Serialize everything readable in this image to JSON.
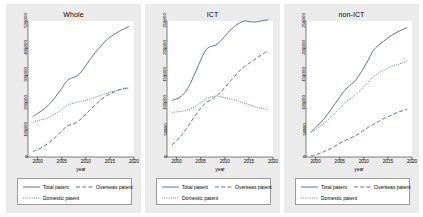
{
  "figure": {
    "background_color": "#ebebeb",
    "plot_background_color": "#ffffff",
    "line_color": "#4a5a7a",
    "axis_color": "#000000"
  },
  "legend": {
    "total_label": "Total patent",
    "overseas_label": "Overseas patent",
    "domestic_label": "Domestic patent"
  },
  "chart_data": [
    {
      "type": "line",
      "title": "Whole",
      "xlabel": "year",
      "ylabel": "",
      "xlim": [
        1998,
        2020
      ],
      "ylim": [
        0,
        500000
      ],
      "xticks": [
        2000,
        2005,
        2010,
        2015,
        2020
      ],
      "yticks": [
        0,
        100000,
        200000,
        300000,
        400000,
        500000
      ],
      "ytick_labels": [
        "0",
        "100000",
        "200000",
        "300000",
        "400000",
        "500000"
      ],
      "xtick_labels": [
        "2000",
        "2005",
        "2010",
        "2015",
        "2020"
      ],
      "grid": false,
      "legend_position": "below",
      "x": [
        1999,
        2000,
        2001,
        2002,
        2003,
        2004,
        2005,
        2006,
        2007,
        2008,
        2009,
        2010,
        2011,
        2012,
        2013,
        2014,
        2015,
        2016,
        2017,
        2018,
        2019
      ],
      "series": [
        {
          "name": "Total patent",
          "style": "solid",
          "values": [
            148000,
            160000,
            172000,
            187000,
            205000,
            228000,
            252000,
            278000,
            290000,
            296000,
            312000,
            336000,
            362000,
            385000,
            405000,
            425000,
            440000,
            452000,
            463000,
            472000,
            480000
          ]
        },
        {
          "name": "Overseas patent",
          "style": "dashed",
          "values": [
            20000,
            27000,
            36000,
            48000,
            62000,
            78000,
            96000,
            112000,
            120000,
            126000,
            140000,
            158000,
            175000,
            192000,
            208000,
            222000,
            232000,
            240000,
            248000,
            252000,
            256000
          ]
        },
        {
          "name": "Domestic patent",
          "style": "dotted",
          "values": [
            128000,
            133000,
            138000,
            143000,
            152000,
            163000,
            175000,
            188000,
            196000,
            200000,
            204000,
            209000,
            214000,
            220000,
            226000,
            232000,
            238000,
            243000,
            247000,
            250000,
            254000
          ]
        }
      ]
    },
    {
      "type": "line",
      "title": "ICT",
      "xlabel": "year",
      "ylabel": "",
      "xlim": [
        1998,
        2020
      ],
      "ylim": [
        0,
        250000
      ],
      "xticks": [
        2000,
        2005,
        2010,
        2015,
        2020
      ],
      "yticks": [
        0,
        50000,
        100000,
        150000,
        200000,
        250000
      ],
      "ytick_labels": [
        "0",
        "50000",
        "100000",
        "150000",
        "200000",
        "250000"
      ],
      "xtick_labels": [
        "2000",
        "2005",
        "2010",
        "2015",
        "2020"
      ],
      "grid": false,
      "legend_position": "below",
      "x": [
        1999,
        2000,
        2001,
        2002,
        2003,
        2004,
        2005,
        2006,
        2007,
        2008,
        2009,
        2010,
        2011,
        2012,
        2013,
        2014,
        2015,
        2016,
        2017,
        2018,
        2019
      ],
      "series": [
        {
          "name": "Total patent",
          "style": "solid",
          "values": [
            104000,
            107000,
            112000,
            122000,
            138000,
            158000,
            178000,
            196000,
            203000,
            205000,
            212000,
            222000,
            232000,
            240000,
            246000,
            250000,
            249000,
            248000,
            249000,
            251000,
            252000
          ]
        },
        {
          "name": "Overseas patent",
          "style": "dashed",
          "values": [
            22000,
            30000,
            40000,
            52000,
            65000,
            78000,
            90000,
            99000,
            105000,
            110000,
            118000,
            128000,
            138000,
            148000,
            158000,
            166000,
            172000,
            178000,
            184000,
            190000,
            196000
          ]
        },
        {
          "name": "Domestic patent",
          "style": "dotted",
          "values": [
            82000,
            83000,
            84000,
            86000,
            89000,
            94000,
            100000,
            106000,
            110000,
            112000,
            111000,
            109000,
            107000,
            105000,
            102000,
            99000,
            96000,
            93000,
            91000,
            89000,
            87000
          ]
        }
      ]
    },
    {
      "type": "line",
      "title": "non-ICT",
      "xlabel": "year",
      "ylabel": "",
      "xlim": [
        1998,
        2020
      ],
      "ylim": [
        0,
        250000
      ],
      "xticks": [
        2000,
        2005,
        2010,
        2015,
        2020
      ],
      "yticks": [
        0,
        50000,
        100000,
        150000,
        200000,
        250000
      ],
      "ytick_labels": [
        "0",
        "50000",
        "100000",
        "150000",
        "200000",
        "250000"
      ],
      "xtick_labels": [
        "2000",
        "2005",
        "2010",
        "2015",
        "2020"
      ],
      "grid": false,
      "legend_position": "below",
      "x": [
        1999,
        2000,
        2001,
        2002,
        2003,
        2004,
        2005,
        2006,
        2007,
        2008,
        2009,
        2010,
        2011,
        2012,
        2013,
        2014,
        2015,
        2016,
        2017,
        2018,
        2019
      ],
      "series": [
        {
          "name": "Total patent",
          "style": "solid",
          "values": [
            46000,
            54000,
            63000,
            73000,
            85000,
            98000,
            110000,
            122000,
            131000,
            138000,
            150000,
            164000,
            180000,
            196000,
            205000,
            212000,
            219000,
            225000,
            230000,
            234000,
            238000
          ]
        },
        {
          "name": "Overseas patent",
          "style": "dashed",
          "values": [
            2000,
            4000,
            7000,
            11000,
            15000,
            20000,
            25000,
            30000,
            34000,
            38000,
            43000,
            49000,
            55000,
            60000,
            65000,
            70000,
            74000,
            78000,
            82000,
            85000,
            88000
          ]
        },
        {
          "name": "Domestic patent",
          "style": "dotted",
          "values": [
            44000,
            50000,
            57000,
            64000,
            72000,
            81000,
            90000,
            99000,
            106000,
            112000,
            120000,
            129000,
            139000,
            148000,
            154000,
            159000,
            163000,
            167000,
            170000,
            173000,
            176000
          ]
        }
      ]
    }
  ]
}
